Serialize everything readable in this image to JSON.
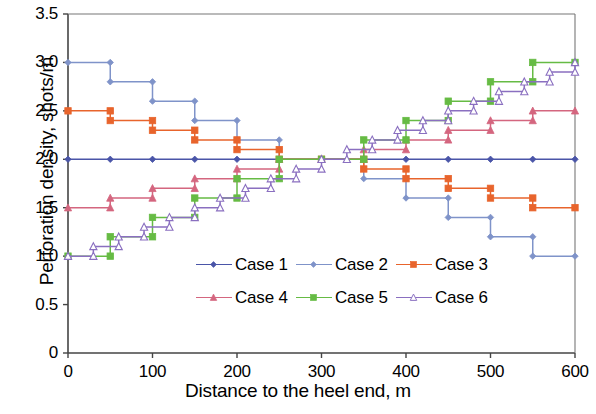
{
  "chart_data": {
    "type": "line",
    "title": "",
    "xlabel": "Distance to the heel end, m",
    "ylabel": "Perforation density, shots/m",
    "xlim": [
      0,
      600
    ],
    "ylim": [
      0,
      3.5
    ],
    "xticks": [
      0,
      100,
      200,
      300,
      400,
      500,
      600
    ],
    "yticks": [
      "0",
      "0.5",
      "1.0",
      "1.5",
      "2.0",
      "2.5",
      "3.0",
      "3.5"
    ],
    "ytick_values": [
      0,
      0.5,
      1.0,
      1.5,
      2.0,
      2.5,
      3.0,
      3.5
    ],
    "grid": false,
    "legend_position": "center",
    "step_style": "post",
    "series": [
      {
        "name": "Case 1",
        "color": "#4a55a8",
        "marker": "diamond",
        "marker_filled": true,
        "x": [
          0,
          50,
          100,
          150,
          200,
          250,
          300,
          350,
          400,
          450,
          500,
          550,
          600
        ],
        "values": [
          2.0,
          2.0,
          2.0,
          2.0,
          2.0,
          2.0,
          2.0,
          2.0,
          2.0,
          2.0,
          2.0,
          2.0,
          2.0
        ]
      },
      {
        "name": "Case 2",
        "color": "#7f93c9",
        "marker": "diamond",
        "marker_filled": true,
        "x": [
          0,
          50,
          100,
          150,
          200,
          250,
          300,
          350,
          400,
          450,
          500,
          550,
          600
        ],
        "values": [
          3.0,
          2.8,
          2.6,
          2.4,
          2.2,
          2.0,
          2.0,
          1.8,
          1.6,
          1.4,
          1.2,
          1.0,
          1.0
        ]
      },
      {
        "name": "Case 3",
        "color": "#e8642c",
        "marker": "square",
        "marker_filled": true,
        "x": [
          0,
          50,
          100,
          150,
          200,
          250,
          300,
          350,
          400,
          450,
          500,
          550,
          600
        ],
        "values": [
          2.5,
          2.4,
          2.3,
          2.2,
          2.1,
          2.0,
          2.0,
          1.9,
          1.8,
          1.7,
          1.6,
          1.5,
          1.5
        ]
      },
      {
        "name": "Case 4",
        "color": "#d4667f",
        "marker": "triangle",
        "marker_filled": true,
        "x": [
          0,
          50,
          100,
          150,
          200,
          250,
          300,
          350,
          400,
          450,
          500,
          550,
          600
        ],
        "values": [
          1.5,
          1.6,
          1.7,
          1.8,
          1.9,
          2.0,
          2.0,
          2.1,
          2.2,
          2.3,
          2.4,
          2.5,
          2.5
        ]
      },
      {
        "name": "Case 5",
        "color": "#66bb44",
        "marker": "square",
        "marker_filled": true,
        "x": [
          0,
          50,
          100,
          150,
          200,
          250,
          300,
          350,
          400,
          450,
          500,
          550,
          600
        ],
        "values": [
          1.0,
          1.2,
          1.4,
          1.6,
          1.8,
          2.0,
          2.0,
          2.2,
          2.4,
          2.6,
          2.8,
          3.0,
          3.0
        ]
      },
      {
        "name": "Case 6",
        "color": "#8a6fc0",
        "marker": "triangle-open",
        "marker_filled": false,
        "x": [
          0,
          30,
          60,
          90,
          120,
          150,
          180,
          210,
          240,
          270,
          300,
          330,
          360,
          390,
          420,
          450,
          480,
          510,
          540,
          570,
          600
        ],
        "values": [
          1.0,
          1.1,
          1.2,
          1.3,
          1.4,
          1.5,
          1.6,
          1.7,
          1.8,
          1.9,
          2.0,
          2.1,
          2.2,
          2.3,
          2.4,
          2.5,
          2.6,
          2.7,
          2.8,
          2.9,
          3.0
        ]
      }
    ]
  },
  "legend": {
    "rows": [
      [
        {
          "label": "Case 1"
        },
        {
          "label": "Case 2"
        },
        {
          "label": "Case 3"
        }
      ],
      [
        {
          "label": "Case 4"
        },
        {
          "label": "Case 5"
        },
        {
          "label": "Case 6"
        }
      ]
    ]
  },
  "axes": {
    "ylabel": "Perforation density, shots/m",
    "xlabel": "Distance to the heel end, m",
    "ytick_labels": [
      "3.5",
      "3.0",
      "2.5",
      "2.0",
      "1.5",
      "1.0",
      "0.5",
      "0"
    ],
    "xtick_labels": [
      "0",
      "100",
      "200",
      "300",
      "400",
      "500",
      "600"
    ]
  }
}
